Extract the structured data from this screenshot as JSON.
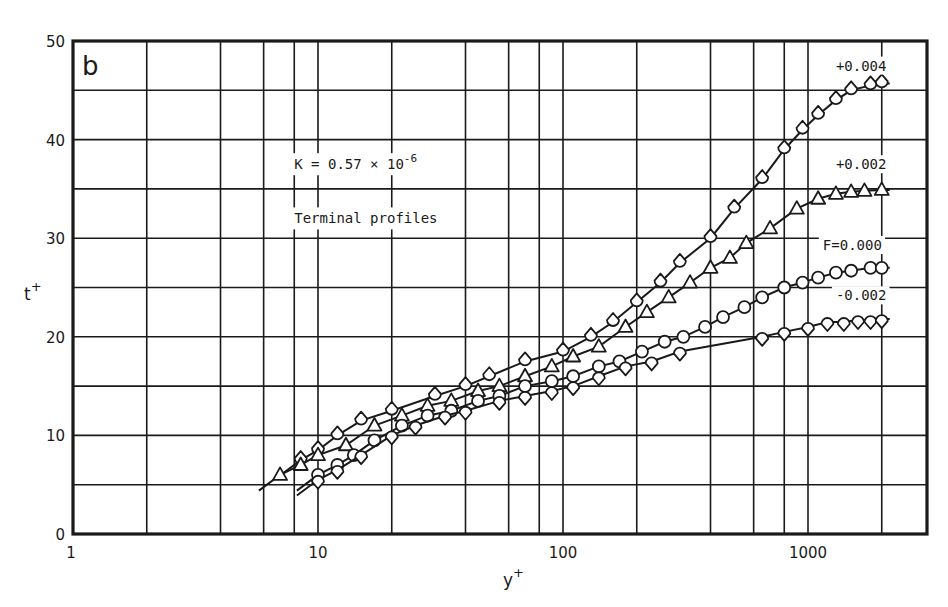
{
  "chart_data": {
    "type": "line",
    "panel_label": "b",
    "title": "",
    "xlabel": "y+",
    "ylabel": "t+",
    "xscale": "log",
    "xlim": [
      1,
      2800
    ],
    "ylim": [
      0,
      50
    ],
    "grid": true,
    "x_ticks": [
      {
        "value": 1,
        "label": "1"
      },
      {
        "value": 10,
        "label": "10"
      },
      {
        "value": 100,
        "label": "100"
      },
      {
        "value": 1000,
        "label": "1000"
      }
    ],
    "y_ticks": [
      {
        "value": 0,
        "label": "0"
      },
      {
        "value": 10,
        "label": "10"
      },
      {
        "value": 20,
        "label": "20"
      },
      {
        "value": 30,
        "label": "30"
      },
      {
        "value": 40,
        "label": "40"
      },
      {
        "value": 50,
        "label": "50"
      }
    ],
    "x_grid": [
      2,
      4,
      6,
      8,
      10,
      20,
      40,
      60,
      80,
      100,
      200,
      400,
      600,
      800,
      1000,
      2000
    ],
    "y_grid": [
      5,
      10,
      15,
      20,
      25,
      30,
      35,
      40,
      45
    ],
    "annotations": [
      {
        "text": "K = 0.57 × 10",
        "sup": "-6",
        "x": 8,
        "y": 37
      },
      {
        "text": "Terminal profiles",
        "x": 8,
        "y": 31.5
      }
    ],
    "series": [
      {
        "name": "+0.004",
        "label": "+0.004",
        "marker": "drop-up",
        "label_pos": {
          "x": 1300,
          "y": 47
        },
        "points": [
          [
            8.5,
            7.5
          ],
          [
            10,
            8.5
          ],
          [
            12,
            10
          ],
          [
            15,
            11.5
          ],
          [
            20,
            12.5
          ],
          [
            30,
            14
          ],
          [
            40,
            15
          ],
          [
            50,
            16
          ],
          [
            70,
            17.5
          ],
          [
            100,
            18.5
          ],
          [
            130,
            20
          ],
          [
            160,
            21.5
          ],
          [
            200,
            23.5
          ],
          [
            250,
            25.5
          ],
          [
            300,
            27.5
          ],
          [
            400,
            30
          ],
          [
            500,
            33
          ],
          [
            650,
            36
          ],
          [
            800,
            39
          ],
          [
            950,
            41
          ],
          [
            1100,
            42.5
          ],
          [
            1300,
            44
          ],
          [
            1500,
            45
          ],
          [
            1800,
            45.5
          ],
          [
            2000,
            45.7
          ]
        ]
      },
      {
        "name": "+0.002",
        "label": "+0.002",
        "marker": "triangle",
        "label_pos": {
          "x": 1300,
          "y": 37
        },
        "points": [
          [
            7,
            6
          ],
          [
            8.5,
            7
          ],
          [
            10,
            8
          ],
          [
            13,
            9
          ],
          [
            17,
            11
          ],
          [
            22,
            12
          ],
          [
            28,
            13
          ],
          [
            35,
            13.5
          ],
          [
            45,
            14.5
          ],
          [
            55,
            15
          ],
          [
            70,
            16
          ],
          [
            90,
            17
          ],
          [
            110,
            18
          ],
          [
            140,
            19
          ],
          [
            180,
            21
          ],
          [
            220,
            22.5
          ],
          [
            270,
            24
          ],
          [
            330,
            25.5
          ],
          [
            400,
            27
          ],
          [
            480,
            28
          ],
          [
            560,
            29.5
          ],
          [
            700,
            31
          ],
          [
            900,
            33
          ],
          [
            1100,
            34
          ],
          [
            1300,
            34.5
          ],
          [
            1500,
            34.7
          ],
          [
            1700,
            34.8
          ],
          [
            2000,
            34.9
          ]
        ]
      },
      {
        "name": "F=0.000",
        "label": "F=0.000",
        "marker": "circle",
        "label_pos": {
          "x": 1150,
          "y": 28.8
        },
        "points": [
          [
            10,
            6
          ],
          [
            12,
            7
          ],
          [
            14,
            8
          ],
          [
            17,
            9.5
          ],
          [
            22,
            11
          ],
          [
            28,
            12
          ],
          [
            35,
            12.5
          ],
          [
            45,
            13.5
          ],
          [
            55,
            14
          ],
          [
            70,
            15
          ],
          [
            90,
            15.5
          ],
          [
            110,
            16
          ],
          [
            140,
            17
          ],
          [
            170,
            17.5
          ],
          [
            210,
            18.5
          ],
          [
            260,
            19.5
          ],
          [
            310,
            20
          ],
          [
            380,
            21
          ],
          [
            450,
            22
          ],
          [
            550,
            23
          ],
          [
            650,
            24
          ],
          [
            800,
            25
          ],
          [
            950,
            25.5
          ],
          [
            1100,
            26
          ],
          [
            1300,
            26.5
          ],
          [
            1500,
            26.7
          ],
          [
            1800,
            27
          ],
          [
            2000,
            27
          ]
        ]
      },
      {
        "name": "-0.002",
        "label": "-0.002",
        "marker": "drop-down",
        "label_pos": {
          "x": 1300,
          "y": 23.7
        },
        "points": [
          [
            10,
            5.5
          ],
          [
            12,
            6.5
          ],
          [
            15,
            8
          ],
          [
            20,
            10
          ],
          [
            25,
            11
          ],
          [
            33,
            12
          ],
          [
            40,
            12.5
          ],
          [
            55,
            13.5
          ],
          [
            70,
            14
          ],
          [
            90,
            14.5
          ],
          [
            110,
            15
          ],
          [
            140,
            16
          ],
          [
            180,
            17
          ],
          [
            230,
            17.5
          ],
          [
            300,
            18.5
          ],
          [
            650,
            20
          ],
          [
            800,
            20.5
          ],
          [
            1000,
            21
          ],
          [
            1200,
            21.5
          ],
          [
            1400,
            21.5
          ],
          [
            1600,
            21.7
          ],
          [
            1800,
            21.7
          ],
          [
            2000,
            21.8
          ]
        ]
      }
    ]
  },
  "style": {
    "ink": "#1a1a1a",
    "background": "#ffffff"
  }
}
